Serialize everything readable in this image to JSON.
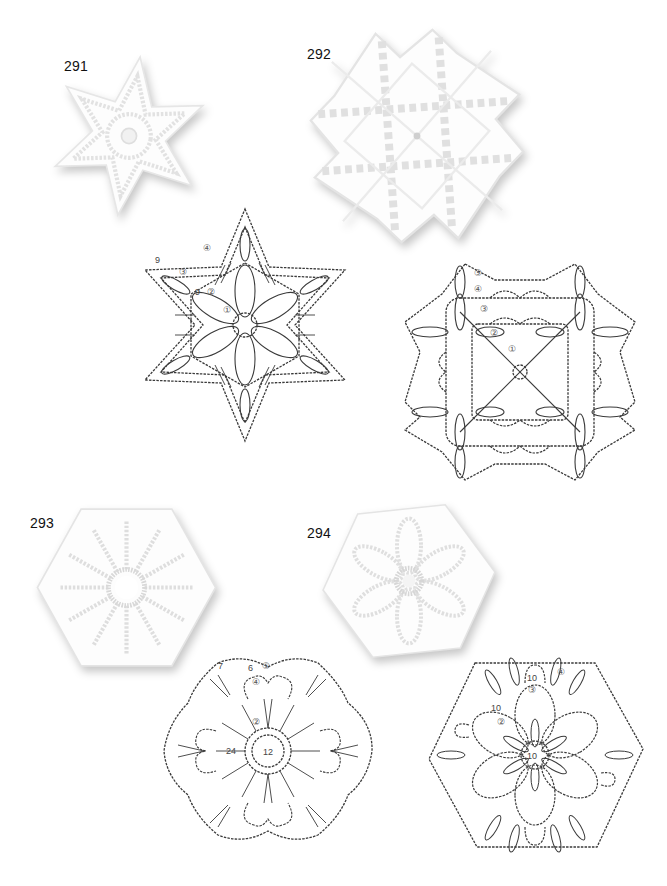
{
  "page": {
    "background": "#ffffff",
    "ink_color": "#333333",
    "lace_color": "#ffffff"
  },
  "motifs": [
    {
      "number": "291",
      "photo": {
        "shape": "six-pointed-star",
        "description": "white crochet star motif"
      },
      "chart": {
        "shape": "six-pointed-star",
        "round_markers": [
          "①",
          "②",
          "③",
          "④"
        ],
        "stitch_counts": [
          "9",
          "9"
        ]
      }
    },
    {
      "number": "292",
      "photo": {
        "shape": "eight-point-lattice",
        "description": "white crochet lattice snowflake"
      },
      "chart": {
        "shape": "octagonal-lattice",
        "round_markers": [
          "①",
          "②",
          "③",
          "④",
          "⑤"
        ],
        "stitch_counts": []
      }
    },
    {
      "number": "293",
      "photo": {
        "shape": "hexagon-flower",
        "description": "white crochet hexagon with ring centre and 12 spokes"
      },
      "chart": {
        "shape": "hexagon-flower",
        "round_markers": [
          "②",
          "④",
          "⑤"
        ],
        "stitch_counts": [
          "12",
          "24",
          "6",
          "7"
        ]
      }
    },
    {
      "number": "294",
      "photo": {
        "shape": "hexagon-flower",
        "description": "white crochet hexagon with 6-petal flower"
      },
      "chart": {
        "shape": "hexagon-petals",
        "round_markers": [
          "②",
          "③",
          "④"
        ],
        "stitch_counts": [
          "10",
          "10",
          "10"
        ]
      }
    }
  ]
}
